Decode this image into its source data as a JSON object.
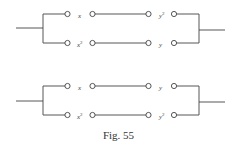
{
  "figure": {
    "caption": "Fig. 55",
    "line_color": "#444444"
  },
  "circuits": [
    {
      "name": "upper-circuit",
      "branches": [
        {
          "switches": [
            {
              "base": "x",
              "sup": ""
            },
            {
              "base": "y",
              "sup": "2"
            }
          ]
        },
        {
          "switches": [
            {
              "base": "x",
              "sup": "2"
            },
            {
              "base": "y",
              "sup": ""
            }
          ]
        }
      ]
    },
    {
      "name": "lower-circuit",
      "branches": [
        {
          "switches": [
            {
              "base": "x",
              "sup": ""
            },
            {
              "base": "y",
              "sup": ""
            }
          ]
        },
        {
          "switches": [
            {
              "base": "x",
              "sup": "2"
            },
            {
              "base": "y",
              "sup": "2"
            }
          ]
        }
      ]
    }
  ]
}
